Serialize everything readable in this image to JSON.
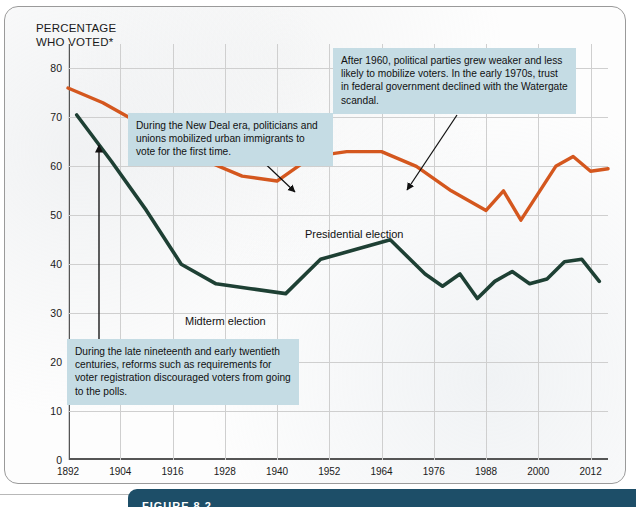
{
  "figure": {
    "axis_title": "PERCENTAGE\nWHO VOTED*",
    "caption_label": "FIGURE 8.2"
  },
  "annotations": [
    {
      "id": "new-deal",
      "text": "During the New Deal era, politicians and unions mobilized urban immigrants to vote for the first time."
    },
    {
      "id": "after-1960",
      "text": "After 1960, political parties grew weaker and less likely to mobilize voters. In the early 1970s, trust in federal government declined with the Watergate scandal."
    },
    {
      "id": "registration-reforms",
      "text": "During the late nineteenth and early twentieth centuries, reforms such as requirements for voter registration discouraged voters from going to the polls."
    }
  ],
  "series_labels": {
    "presidential": "Presidential election",
    "midterm": "Midterm election"
  },
  "colors": {
    "presidential": "#d4571e",
    "midterm": "#1e4034",
    "callout_background": "#c5dce4",
    "grid": "#cfcfcf",
    "caption_bar": "#1d4e68"
  },
  "chart_data": {
    "type": "line",
    "title": "",
    "xlabel": "",
    "ylabel": "PERCENTAGE WHO VOTED*",
    "ylim": [
      0,
      85
    ],
    "xlim": [
      1892,
      2016
    ],
    "grid": true,
    "legend": "inline-labels",
    "ytick_labels": [
      0,
      10,
      20,
      30,
      40,
      50,
      60,
      70,
      80
    ],
    "xtick_labels": [
      1892,
      1904,
      1916,
      1928,
      1940,
      1952,
      1964,
      1976,
      1988,
      2000,
      2012
    ],
    "series": [
      {
        "name": "Presidential election",
        "color": "#d4571e",
        "x": [
          1892,
          1900,
          1908,
          1916,
          1924,
          1932,
          1940,
          1948,
          1956,
          1964,
          1972,
          1980,
          1988,
          1992,
          1996,
          2004,
          2008,
          2012,
          2016
        ],
        "values": [
          76,
          73,
          69,
          65,
          61,
          58,
          57,
          62,
          63,
          63,
          60,
          55,
          51,
          55,
          49,
          60,
          62,
          59,
          59.5
        ]
      },
      {
        "name": "Midterm election",
        "color": "#1e4034",
        "x": [
          1894,
          1902,
          1910,
          1918,
          1926,
          1934,
          1942,
          1950,
          1958,
          1966,
          1974,
          1978,
          1982,
          1986,
          1990,
          1994,
          1998,
          2002,
          2006,
          2010,
          2014
        ],
        "values": [
          70.5,
          61,
          51,
          40,
          36,
          35,
          34,
          41,
          43,
          45,
          38,
          35.5,
          38,
          33,
          36.5,
          38.5,
          36,
          37,
          40.5,
          41,
          36.5
        ]
      }
    ],
    "annotation_arrows": [
      {
        "from_label": "new-deal",
        "to_year": 1940
      },
      {
        "from_label": "after-1960",
        "to_year": 1964
      },
      {
        "from_label": "registration-reforms",
        "to_year": 1892
      }
    ]
  }
}
